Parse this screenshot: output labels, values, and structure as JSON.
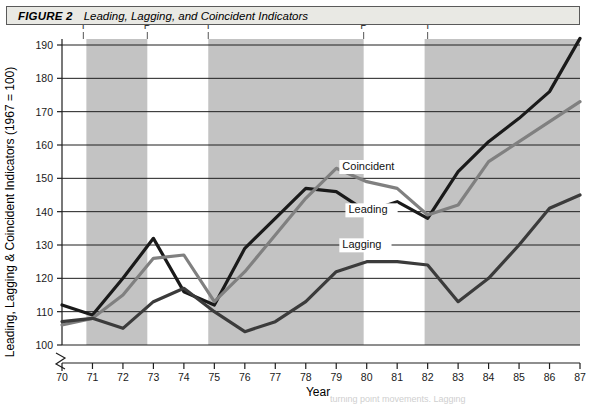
{
  "figure": {
    "label": "FIGURE 2",
    "title": "Leading, Lagging, and Coincident Indicators"
  },
  "caption": {
    "partial_text": "turning point movements. Lagging"
  },
  "chart_data": {
    "type": "line",
    "title": "Leading, Lagging, and Coincident Indicators",
    "xlabel": "Year",
    "ylabel": "Leading, Lagging & Coincident Indicators (1967 = 100)",
    "grid": true,
    "legend_position": "inline-labels",
    "axis_break_below": 100,
    "xlim": [
      70,
      87
    ],
    "ylim": [
      100,
      190
    ],
    "yticks": [
      100,
      110,
      120,
      130,
      140,
      150,
      160,
      170,
      180,
      190
    ],
    "x": [
      70,
      71,
      72,
      73,
      74,
      75,
      76,
      77,
      78,
      79,
      80,
      81,
      82,
      83,
      84,
      85,
      86,
      87
    ],
    "xticklabels": [
      "70",
      "71",
      "72",
      "73",
      "74",
      "75",
      "76",
      "77",
      "78",
      "79",
      "80",
      "81",
      "82",
      "83",
      "84",
      "85",
      "86",
      "87"
    ],
    "series": [
      {
        "name": "Leading",
        "color": "#1a1a1a",
        "label_x": 79.4,
        "label_y": 139.5,
        "values": [
          112,
          109,
          120,
          132,
          116,
          112,
          129,
          138,
          147,
          146,
          140,
          143,
          138,
          152,
          161,
          168,
          176,
          192
        ]
      },
      {
        "name": "Coincident",
        "color": "#808080",
        "label_x": 79.2,
        "label_y": 152.5,
        "values": [
          106,
          108,
          115,
          126,
          127,
          113,
          122,
          133,
          144,
          153,
          149,
          147,
          139,
          142,
          155,
          161,
          167,
          173
        ]
      },
      {
        "name": "Lagging",
        "color": "#3b3b3b",
        "label_x": 79.2,
        "label_y": 129.0,
        "values": [
          107,
          108,
          105,
          113,
          117,
          110,
          104,
          107,
          113,
          122,
          125,
          125,
          124,
          113,
          120,
          130,
          141,
          145
        ]
      }
    ],
    "shaded_bands": [
      {
        "start": 70.8,
        "end": 72.8,
        "color": "#c3c3c3"
      },
      {
        "start": 74.8,
        "end": 79.9,
        "color": "#c3c3c3"
      },
      {
        "start": 81.9,
        "end": 87.0,
        "color": "#c3c3c3"
      }
    ],
    "cycle_markers": [
      {
        "label": "T",
        "x": 70.7
      },
      {
        "label": "P",
        "x": 72.8
      },
      {
        "label": "T",
        "x": 74.8
      },
      {
        "label": "P",
        "x": 79.9
      },
      {
        "label": "T",
        "x": 82.0
      }
    ]
  }
}
